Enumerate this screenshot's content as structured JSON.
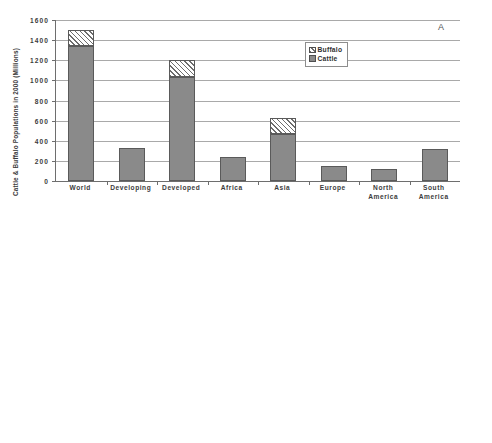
{
  "chart_data": [
    {
      "type": "bar",
      "panel_label": "A",
      "title": "",
      "stacked": true,
      "ylabel": "Cattle & Buffalo Populations in 2000 (Millions)",
      "xlabel": "",
      "ylim": [
        0,
        1600
      ],
      "yticks": [
        0,
        200,
        400,
        600,
        800,
        1000,
        1200,
        1400,
        1600
      ],
      "ytick_labels": [
        "0",
        "200",
        "400",
        "600",
        "800",
        "1000",
        "1200",
        "1400",
        "1600"
      ],
      "grid": true,
      "legend_position": "upper-right-inset",
      "categories": [
        "World",
        "Developing",
        "Developed",
        "Africa",
        "Asia",
        "Europe",
        "North America",
        "South America"
      ],
      "series": [
        {
          "name": "Cattle",
          "values": [
            1340,
            330,
            1030,
            235,
            470,
            145,
            120,
            315
          ]
        },
        {
          "name": "Buffalo",
          "values": [
            165,
            0,
            170,
            0,
            160,
            0,
            0,
            0
          ]
        }
      ],
      "totals": [
        1505,
        330,
        1200,
        235,
        630,
        145,
        120,
        315
      ]
    },
    {
      "type": "bar",
      "panel_label": "B",
      "title": "",
      "stacked": true,
      "ylabel_line1": "Estimate of CH4 Emissions from Cattle & Buffalo",
      "ylabel_line2": "Enteric Fermentation in 2000 (Tg CH4)",
      "xlabel": "",
      "ylim": [
        0,
        70
      ],
      "yticks": [
        0,
        10,
        20,
        30,
        40,
        50,
        60,
        70
      ],
      "ytick_labels": [
        "0",
        "10",
        "20",
        "30",
        "40",
        "50",
        "60",
        "70"
      ],
      "grid": true,
      "legend_position": "upper-right-inset",
      "categories": [
        "World",
        "Developing",
        "Developed",
        "Africa",
        "Asia",
        "Europe",
        "North America",
        "South America"
      ],
      "series": [
        {
          "name": "Cattle",
          "values": [
            54,
            18,
            36,
            8,
            16,
            8,
            6,
            11
          ]
        },
        {
          "name": "Buffalo",
          "values": [
            8,
            8.2,
            0,
            0,
            8.8,
            0,
            0,
            0
          ]
        }
      ],
      "totals": [
        62,
        26.2,
        36,
        8,
        24.8,
        8,
        6,
        11
      ]
    }
  ],
  "legend": {
    "buffalo_label": "Buffalo",
    "cattle_label": "Cattle"
  },
  "colors": {
    "cattle_fill": "#8a8a8a",
    "buffalo_fill": "#ffffff",
    "bar_outline": "#5a5a5a",
    "gridline": "#a9a9a9",
    "axis": "#6e6e6e",
    "text": "#3c3c3c"
  }
}
